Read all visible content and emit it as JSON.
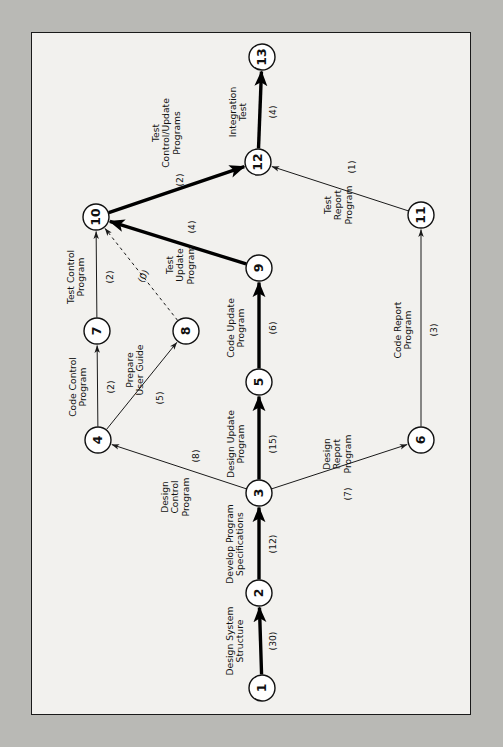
{
  "diagram": {
    "type": "pert-cpm-network",
    "title": "",
    "orientation": "rotated-90-ccw",
    "canvas": {
      "width": 503,
      "height": 747
    },
    "frame": {
      "x": 31,
      "y": 32,
      "width": 440,
      "height": 683,
      "fill": "#f2f1ee",
      "stroke": "#1a1a1a"
    },
    "background_color": "#b9b9b5",
    "node_radius": 13,
    "nodes": [
      {
        "id": "1",
        "label": "1",
        "x": 262,
        "y": 688
      },
      {
        "id": "2",
        "label": "2",
        "x": 259,
        "y": 593
      },
      {
        "id": "3",
        "label": "3",
        "x": 259,
        "y": 493
      },
      {
        "id": "4",
        "label": "4",
        "x": 98,
        "y": 440
      },
      {
        "id": "5",
        "label": "5",
        "x": 259,
        "y": 382
      },
      {
        "id": "6",
        "label": "6",
        "x": 421,
        "y": 440
      },
      {
        "id": "7",
        "label": "7",
        "x": 97,
        "y": 331
      },
      {
        "id": "8",
        "label": "8",
        "x": 186,
        "y": 331
      },
      {
        "id": "9",
        "label": "9",
        "x": 259,
        "y": 268
      },
      {
        "id": "10",
        "label": "10",
        "x": 96,
        "y": 217
      },
      {
        "id": "11",
        "label": "11",
        "x": 421,
        "y": 215
      },
      {
        "id": "12",
        "label": "12",
        "x": 258,
        "y": 162
      },
      {
        "id": "13",
        "label": "13",
        "x": 262,
        "y": 57
      }
    ],
    "edges": [
      {
        "id": "e1-2",
        "from": "1",
        "to": "2",
        "activity": "Design System Structure",
        "duration": "(30)",
        "critical": true,
        "dummy": false,
        "label_x": 235,
        "label_y": 641,
        "dur_x": 273,
        "dur_y": 641,
        "label_rot": -90,
        "label_lines": [
          "Design System",
          "Structure"
        ]
      },
      {
        "id": "e2-3",
        "from": "2",
        "to": "3",
        "activity": "Develop Program Specifications",
        "duration": "(12)",
        "critical": true,
        "dummy": false,
        "label_x": 235,
        "label_y": 544,
        "dur_x": 273,
        "dur_y": 544,
        "label_rot": -90,
        "label_lines": [
          "Develop Program",
          "Specifications"
        ]
      },
      {
        "id": "e3-4",
        "from": "3",
        "to": "4",
        "activity": "Design Control Program",
        "duration": "(8)",
        "critical": false,
        "dummy": false,
        "label_x": 175,
        "label_y": 497,
        "dur_x": 196,
        "dur_y": 456,
        "label_rot": -90,
        "label_lines": [
          "Design",
          "Control",
          "Program"
        ]
      },
      {
        "id": "e3-5",
        "from": "3",
        "to": "5",
        "activity": "Design Update Program",
        "duration": "(15)",
        "critical": true,
        "dummy": false,
        "label_x": 236,
        "label_y": 444,
        "dur_x": 273,
        "dur_y": 444,
        "label_rot": -90,
        "label_lines": [
          "Design Update",
          "Program"
        ]
      },
      {
        "id": "e3-6",
        "from": "3",
        "to": "6",
        "activity": "Design Report Program",
        "duration": "(7)",
        "critical": false,
        "dummy": false,
        "label_x": 337,
        "label_y": 454,
        "dur_x": 348,
        "dur_y": 494,
        "label_rot": -90,
        "label_lines": [
          "Design",
          "Report",
          "Program"
        ]
      },
      {
        "id": "e4-7",
        "from": "4",
        "to": "7",
        "activity": "Code Control Program",
        "duration": "(2)",
        "critical": false,
        "dummy": false,
        "label_x": 78,
        "label_y": 387,
        "dur_x": 111,
        "dur_y": 387,
        "label_rot": -90,
        "label_lines": [
          "Code Control",
          "Program"
        ]
      },
      {
        "id": "e4-8",
        "from": "4",
        "to": "8",
        "activity": "Prepare User Guide",
        "duration": "(5)",
        "critical": false,
        "dummy": false,
        "label_x": 135,
        "label_y": 370,
        "dur_x": 160,
        "dur_y": 398,
        "label_rot": -90,
        "label_lines": [
          "Prepare",
          "User Guide"
        ]
      },
      {
        "id": "e5-9",
        "from": "5",
        "to": "9",
        "activity": "Code Update Program",
        "duration": "(6)",
        "critical": true,
        "dummy": false,
        "label_x": 236,
        "label_y": 328,
        "dur_x": 273,
        "dur_y": 328,
        "label_rot": -90,
        "label_lines": [
          "Code Update",
          "Program"
        ]
      },
      {
        "id": "e6-11",
        "from": "6",
        "to": "11",
        "activity": "Code Report Program",
        "duration": "(3)",
        "critical": false,
        "dummy": false,
        "label_x": 403,
        "label_y": 330,
        "dur_x": 434,
        "dur_y": 330,
        "label_rot": -90,
        "label_lines": [
          "Code Report",
          "Program"
        ]
      },
      {
        "id": "e7-10",
        "from": "7",
        "to": "10",
        "activity": "Test Control Program",
        "duration": "(2)",
        "critical": false,
        "dummy": false,
        "label_x": 76,
        "label_y": 277,
        "dur_x": 110,
        "dur_y": 277,
        "label_rot": -90,
        "label_lines": [
          "Test Control",
          "Program"
        ]
      },
      {
        "id": "e8-10",
        "from": "8",
        "to": "10",
        "activity": "",
        "duration": "(0)",
        "critical": false,
        "dummy": true,
        "label_x": 143,
        "label_y": 276,
        "dur_x": 143,
        "dur_y": 276,
        "label_rot": -62,
        "label_lines": []
      },
      {
        "id": "e9-10",
        "from": "9",
        "to": "10",
        "activity": "Test Update Program",
        "duration": "(4)",
        "critical": true,
        "dummy": false,
        "label_x": 180,
        "label_y": 265,
        "dur_x": 192,
        "dur_y": 227,
        "label_rot": -90,
        "label_lines": [
          "Test",
          "Update",
          "Program"
        ]
      },
      {
        "id": "e10-12",
        "from": "10",
        "to": "12",
        "activity": "Test Control/Update Programs",
        "duration": "(2)",
        "critical": true,
        "dummy": false,
        "label_x": 166,
        "label_y": 133,
        "dur_x": 180,
        "dur_y": 180,
        "label_rot": -90,
        "label_lines": [
          "Test",
          "Control/Update",
          "Programs"
        ]
      },
      {
        "id": "e11-12",
        "from": "11",
        "to": "12",
        "activity": "Test Report Program",
        "duration": "(1)",
        "critical": false,
        "dummy": false,
        "label_x": 338,
        "label_y": 205,
        "dur_x": 352,
        "dur_y": 167,
        "label_rot": -90,
        "label_lines": [
          "Test",
          "Report",
          "Program"
        ]
      },
      {
        "id": "e12-13",
        "from": "12",
        "to": "13",
        "activity": "Integration Test",
        "duration": "(4)",
        "critical": true,
        "dummy": false,
        "label_x": 238,
        "label_y": 112,
        "dur_x": 273,
        "dur_y": 112,
        "label_rot": -90,
        "label_lines": [
          "Integration",
          "Test"
        ]
      }
    ],
    "critical_path": [
      "1",
      "2",
      "3",
      "5",
      "9",
      "10",
      "12",
      "13"
    ],
    "colors": {
      "node_stroke": "#111111",
      "node_fill": "#ffffff",
      "edge": "#1a1a1a",
      "critical_edge": "#000000",
      "text": "#111111"
    }
  }
}
